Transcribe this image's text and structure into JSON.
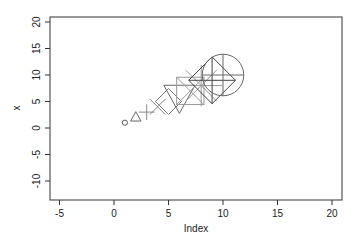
{
  "chart_data": {
    "type": "scatter",
    "title": "",
    "xlabel": "Index",
    "ylabel": "x",
    "xlim": [
      -6,
      21
    ],
    "ylim": [
      -11,
      21
    ],
    "xticks": [
      -5,
      0,
      5,
      10,
      15,
      20
    ],
    "yticks": [
      -10,
      -5,
      0,
      5,
      10,
      15,
      20
    ],
    "grid": false,
    "legend": null,
    "series": [
      {
        "name": "x",
        "x": [
          1,
          2,
          3,
          4,
          5,
          6,
          7,
          8,
          9,
          10
        ],
        "y": [
          1,
          2,
          3,
          4,
          5,
          6,
          7,
          8,
          9,
          10
        ],
        "pch": [
          1,
          2,
          3,
          4,
          5,
          6,
          7,
          8,
          9,
          10
        ],
        "cex": [
          1,
          2,
          3,
          4,
          5,
          6,
          7,
          8,
          9,
          10
        ],
        "symbols": [
          "circle",
          "triangle-up",
          "plus",
          "cross",
          "diamond",
          "triangle-down",
          "square-cross",
          "asterisk",
          "diamond-plus",
          "circle-plus"
        ]
      }
    ]
  },
  "axes": {
    "x_title": "Index",
    "y_title": "x",
    "x_tick_labels": [
      "-5",
      "0",
      "5",
      "10",
      "15",
      "20"
    ],
    "y_tick_labels": [
      "-10",
      "-5",
      "0",
      "5",
      "10",
      "15",
      "20"
    ]
  }
}
